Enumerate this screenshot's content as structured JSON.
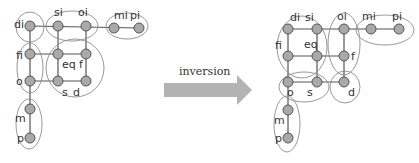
{
  "arrow": {
    "label": "inversion",
    "color": "#b3b3b3"
  },
  "left": {
    "nodes": {
      "di": "di",
      "si": "si",
      "oi": "oi",
      "mi": "mi",
      "pi": "pi",
      "fi": "fi",
      "eq": "eq",
      "f": "f",
      "o": "o",
      "s": "s",
      "d": "d",
      "m": "m",
      "p": "p"
    },
    "groups": [
      [
        "di"
      ],
      [
        "si",
        "oi"
      ],
      [
        "mi",
        "pi"
      ],
      [
        "fi",
        "o"
      ],
      [
        "eq",
        "f",
        "s",
        "d"
      ],
      [
        "m",
        "p"
      ]
    ]
  },
  "right": {
    "nodes": {
      "di": "di",
      "si": "si",
      "oi": "oi",
      "mi": "mi",
      "pi": "pi",
      "fi": "fi",
      "eq": "eq",
      "f": "f",
      "o": "o",
      "s": "s",
      "d": "d",
      "m": "m",
      "p": "p"
    },
    "groups": [
      [
        "di",
        "si",
        "fi",
        "eq"
      ],
      [
        "oi",
        "f"
      ],
      [
        "mi",
        "pi"
      ],
      [
        "o",
        "s"
      ],
      [
        "d"
      ],
      [
        "m",
        "p"
      ]
    ]
  }
}
